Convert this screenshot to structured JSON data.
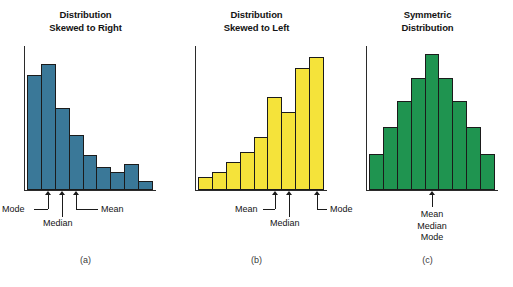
{
  "figure": {
    "background": "#ffffff",
    "panel_count": 3
  },
  "panels": [
    {
      "id": "panel-a",
      "title_line1": "Distribution",
      "title_line2": "Skewed to Right",
      "caption": "(a)",
      "color": "#3a7898",
      "labels": {
        "mode": "Mode",
        "median": "Median",
        "mean": "Mean"
      }
    },
    {
      "id": "panel-b",
      "title_line1": "Distribution",
      "title_line2": "Skewed to Left",
      "caption": "(b)",
      "color": "#f5e33a",
      "labels": {
        "mean": "Mean",
        "median": "Median",
        "mode": "Mode"
      }
    },
    {
      "id": "panel-c",
      "title_line1": "Symmetric",
      "title_line2": "Distribution",
      "caption": "(c)",
      "color": "#1f9450",
      "labels": {
        "mean": "Mean",
        "median": "Median",
        "mode": "Mode"
      }
    }
  ],
  "chart_data": [
    {
      "type": "bar",
      "title": "Distribution Skewed to Right",
      "caption": "(a)",
      "xlabel": "",
      "ylabel": "",
      "grid": false,
      "legend": "none",
      "bar_color": "#3a7898",
      "bar_edge_color": "#1b1b1b",
      "categories": [
        "1",
        "2",
        "3",
        "4",
        "5",
        "6",
        "7",
        "8",
        "9"
      ],
      "values": [
        80,
        88,
        57,
        38,
        24,
        16,
        12,
        18,
        6
      ],
      "ylim": [
        0,
        100
      ],
      "annotations": [
        {
          "label": "Mode",
          "at_category_index": 1,
          "connector": "elbow-left"
        },
        {
          "label": "Median",
          "at_category_index": 2,
          "connector": "straight-down"
        },
        {
          "label": "Mean",
          "at_category_index": 3,
          "connector": "elbow-right"
        }
      ]
    },
    {
      "type": "bar",
      "title": "Distribution Skewed to Left",
      "caption": "(b)",
      "xlabel": "",
      "ylabel": "",
      "grid": false,
      "legend": "none",
      "bar_color": "#f5e33a",
      "bar_edge_color": "#1b1b1b",
      "categories": [
        "1",
        "2",
        "3",
        "4",
        "5",
        "6",
        "7",
        "8",
        "9"
      ],
      "values": [
        9,
        12,
        19,
        26,
        37,
        65,
        54,
        85,
        93
      ],
      "ylim": [
        0,
        100
      ],
      "annotations": [
        {
          "label": "Mean",
          "at_category_index": 5,
          "connector": "elbow-left"
        },
        {
          "label": "Median",
          "at_category_index": 6,
          "connector": "straight-down"
        },
        {
          "label": "Mode",
          "at_category_index": 8,
          "connector": "elbow-right"
        }
      ]
    },
    {
      "type": "bar",
      "title": "Symmetric Distribution",
      "caption": "(c)",
      "xlabel": "",
      "ylabel": "",
      "grid": false,
      "legend": "none",
      "bar_color": "#1f9450",
      "bar_edge_color": "#1b1b1b",
      "categories": [
        "1",
        "2",
        "3",
        "4",
        "5",
        "6",
        "7",
        "8",
        "9"
      ],
      "values": [
        25,
        44,
        62,
        78,
        95,
        78,
        62,
        44,
        25
      ],
      "ylim": [
        0,
        100
      ],
      "annotations": [
        {
          "label": "Mean",
          "at_category_index": 4,
          "connector": "straight-down"
        },
        {
          "label": "Median",
          "at_category_index": 4,
          "connector": "none"
        },
        {
          "label": "Mode",
          "at_category_index": 4,
          "connector": "none"
        }
      ]
    }
  ]
}
